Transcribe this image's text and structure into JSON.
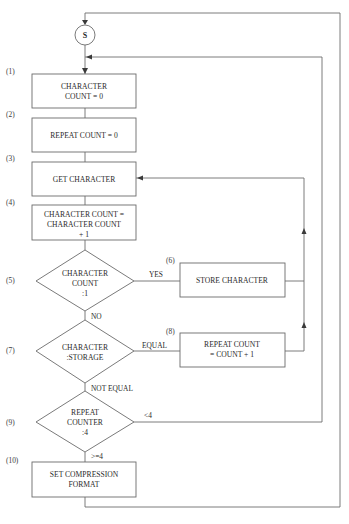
{
  "diagram": {
    "type": "flowchart",
    "start": {
      "label": "S"
    },
    "steps": [
      {
        "number": "(1)",
        "kind": "process",
        "lines": [
          "CHARACTER",
          "COUNT = 0"
        ]
      },
      {
        "number": "(2)",
        "kind": "process",
        "lines": [
          "REPEAT COUNT = 0"
        ]
      },
      {
        "number": "(3)",
        "kind": "process",
        "lines": [
          "GET CHARACTER"
        ]
      },
      {
        "number": "(4)",
        "kind": "process",
        "lines": [
          "CHARACTER COUNT =",
          "CHARACTER COUNT",
          "+ 1"
        ]
      },
      {
        "number": "(5)",
        "kind": "decision",
        "lines": [
          "CHARACTER",
          "COUNT",
          ":1"
        ]
      },
      {
        "number": "(6)",
        "kind": "process",
        "lines": [
          "STORE CHARACTER"
        ]
      },
      {
        "number": "(7)",
        "kind": "decision",
        "lines": [
          "CHARACTER",
          ":STORAGE"
        ]
      },
      {
        "number": "(8)",
        "kind": "process",
        "lines": [
          "REPEAT COUNT",
          "= COUNT + 1"
        ]
      },
      {
        "number": "(9)",
        "kind": "decision",
        "lines": [
          "REPEAT",
          "COUNTER",
          ":4"
        ]
      },
      {
        "number": "(10)",
        "kind": "process",
        "lines": [
          "SET COMPRESSION",
          "FORMAT"
        ]
      }
    ],
    "edge_labels": {
      "yes": "YES",
      "no": "NO",
      "equal": "EQUAL",
      "not_equal": "NOT EQUAL",
      "less_than_4": "<4",
      "gte_4": ">=4"
    },
    "connections": [
      "S -> (1)",
      "(1) -> (2)",
      "(2) -> (3)",
      "(3) -> (4)",
      "(4) -> (5)",
      "(5) YES -> (6)",
      "(6) -> (3)",
      "(5) NO -> (7)",
      "(7) EQUAL -> (8)",
      "(8) -> (3)",
      "(7) NOT EQUAL -> (9)",
      "(9) <4 -> (1)",
      "(9) >=4 -> (10)",
      "(10) -> S"
    ]
  }
}
